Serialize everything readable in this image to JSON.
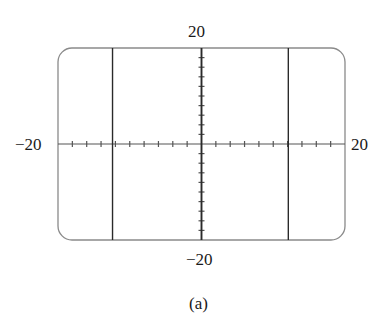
{
  "chart_data": {
    "type": "line",
    "title": "",
    "caption": "(a)",
    "xlabel": "",
    "ylabel": "",
    "xlim": [
      -20,
      20
    ],
    "ylim": [
      -20,
      20
    ],
    "tick_labels": {
      "x_min": "−20",
      "x_max": "20",
      "y_min": "−20",
      "y_max": "20"
    },
    "x_tick_step": 2,
    "y_tick_step": 2,
    "grid": false,
    "legend": null,
    "window_style": "graphing-calculator screen with rounded corners",
    "series": [
      {
        "name": "vertical line (asymptote) left",
        "kind": "vertical_line",
        "x": -12.4
      },
      {
        "name": "vertical line (asymptote) right",
        "kind": "vertical_line",
        "x": 12.1
      },
      {
        "name": "curve hugging y-axis",
        "kind": "vertical_line",
        "x": 0
      }
    ]
  },
  "labels": {
    "y_max": "20",
    "y_min": "−20",
    "x_min": "−20",
    "x_max": "20",
    "caption": "(a)"
  },
  "colors": {
    "frame": "#8a8a8a",
    "axis": "#555555",
    "curve": "#2a2a2a",
    "text": "#1a1a1a"
  },
  "plot_box": {
    "left": 58,
    "top": 48,
    "right": 345,
    "bottom": 240,
    "corner_radius": 14
  }
}
